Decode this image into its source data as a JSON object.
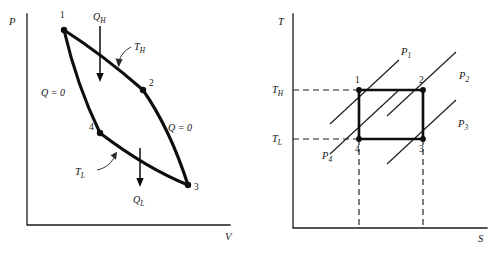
{
  "figure": {
    "caption": "",
    "panels": [
      {
        "id": "pv-diagram",
        "name": "pressure-volume-diagram",
        "axes": {
          "y_label": "P",
          "x_label": "V"
        },
        "state_points": [
          {
            "label": "1",
            "x": 64,
            "y": 30
          },
          {
            "label": "2",
            "x": 143,
            "y": 90
          },
          {
            "label": "3",
            "x": 188,
            "y": 185
          },
          {
            "label": "4",
            "x": 100,
            "y": 133
          }
        ],
        "process_labels": [
          {
            "text": "Q",
            "sub": "H",
            "kind": "heat-in",
            "x": 93,
            "y": 17
          },
          {
            "text": "Q",
            "sub": "L",
            "kind": "heat-out",
            "x": 133,
            "y": 203
          },
          {
            "text": "T",
            "sub": "H",
            "kind": "isotherm-high",
            "x": 134,
            "y": 48
          },
          {
            "text": "T",
            "sub": "L",
            "kind": "isotherm-low",
            "x": 81,
            "y": 171
          },
          {
            "text": "Q = 0",
            "kind": "adiabatic-left",
            "x": 41,
            "y": 93
          },
          {
            "text": "Q = 0",
            "kind": "adiabatic-right",
            "x": 168,
            "y": 128
          }
        ]
      },
      {
        "id": "ts-diagram",
        "name": "temperature-entropy-diagram",
        "axes": {
          "y_label": "T",
          "x_label": "S"
        },
        "state_points": [
          {
            "label": "1",
            "x": 359,
            "y": 90
          },
          {
            "label": "2",
            "x": 423,
            "y": 90
          },
          {
            "label": "3",
            "x": 423,
            "y": 139
          },
          {
            "label": "4",
            "x": 359,
            "y": 139
          }
        ],
        "tick_labels": [
          {
            "text": "T",
            "sub": "H",
            "x": 276,
            "y": 93
          },
          {
            "text": "T",
            "sub": "L",
            "x": 276,
            "y": 142
          }
        ],
        "pressure_lines": [
          {
            "text": "P",
            "sub": "1",
            "x": 402,
            "y": 52
          },
          {
            "text": "P",
            "sub": "2",
            "x": 460,
            "y": 76
          },
          {
            "text": "P",
            "sub": "3",
            "x": 459,
            "y": 124
          },
          {
            "text": "P",
            "sub": "4",
            "x": 325,
            "y": 156
          }
        ]
      }
    ]
  },
  "colors": {
    "ink": "#0d0d0d",
    "axis": "#1b1b1b",
    "background": "#ffffff"
  }
}
